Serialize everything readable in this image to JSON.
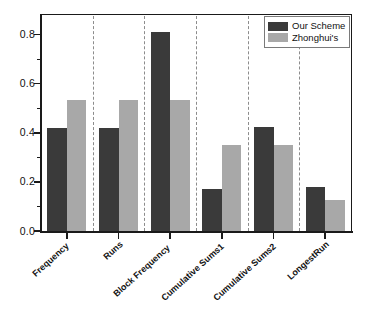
{
  "chart_data": {
    "type": "bar",
    "title": "",
    "subtitle": "",
    "xlabel": "",
    "ylabel": "",
    "ylim": [
      0.0,
      0.88
    ],
    "xlim": [
      0,
      6
    ],
    "grid": false,
    "grid_style": "dashed vertical group separators",
    "legend_position": "top-right",
    "orientation": "vertical",
    "bar_grouping": "grouped",
    "categories": [
      "Frequency",
      "Runs",
      "Block Frequency",
      "Cumulative Sums1",
      "Cumulative Sums2",
      "LongestRun"
    ],
    "series": [
      {
        "name": "Our Scheme",
        "color": "#3a3a3a",
        "values": [
          0.42,
          0.42,
          0.81,
          0.17,
          0.425,
          0.18
        ]
      },
      {
        "name": "Zhonghui's",
        "color": "#a8a8a8",
        "values": [
          0.535,
          0.535,
          0.535,
          0.35,
          0.35,
          0.125
        ]
      }
    ],
    "y_ticks_major": [
      0.0,
      0.2,
      0.4,
      0.6,
      0.8
    ],
    "y_tick_labels": [
      "0.0",
      "0.2",
      "0.4",
      "0.6",
      "0.8"
    ],
    "y_ticks_minor": [
      0.1,
      0.3,
      0.5,
      0.7
    ],
    "x_tick_labels": [
      "Frequency",
      "Runs",
      "Block Frequency",
      "Cumulative Sums1",
      "Cumulative Sums2",
      "LongestRun"
    ],
    "x_label_rotation_deg": -42,
    "annotations": []
  },
  "legend": {
    "items": [
      {
        "label": "Our Scheme",
        "color": "#3a3a3a"
      },
      {
        "label": "Zhonghui's",
        "color": "#a8a8a8"
      }
    ]
  },
  "colors": {
    "series_dark": "#3a3a3a",
    "series_light": "#a8a8a8",
    "axis": "#1a1a1a",
    "separator": "#8c8c8c",
    "background": "#ffffff"
  }
}
